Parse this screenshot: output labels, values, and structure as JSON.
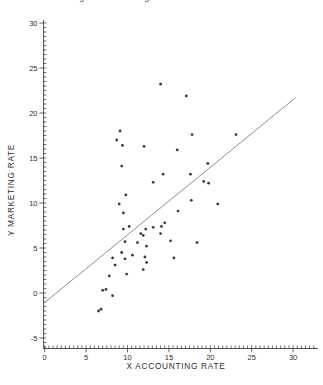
{
  "header": {
    "clipped_title": "accounting and marketing rates"
  },
  "chart_data": {
    "type": "scatter",
    "title": "",
    "xlabel": "X ACCOUNTING RATE",
    "ylabel": "Y MARKETING RATE",
    "xlim": [
      0,
      31.5
    ],
    "ylim": [
      -5,
      30
    ],
    "x_major_ticks": [
      0,
      5,
      10,
      15,
      20,
      25,
      30
    ],
    "y_major_ticks": [
      -5,
      0,
      5,
      10,
      15,
      20,
      25,
      30
    ],
    "minor_tick_step": 0.5,
    "grid": false,
    "legend": false,
    "points": [
      [
        14.0,
        23.2
      ],
      [
        17.1,
        21.9
      ],
      [
        9.1,
        18.0
      ],
      [
        17.8,
        17.6
      ],
      [
        23.1,
        17.6
      ],
      [
        8.7,
        17.0
      ],
      [
        9.4,
        16.4
      ],
      [
        12.0,
        16.3
      ],
      [
        16.0,
        15.9
      ],
      [
        9.3,
        14.1
      ],
      [
        19.7,
        14.4
      ],
      [
        14.3,
        13.2
      ],
      [
        17.6,
        13.2
      ],
      [
        13.1,
        12.3
      ],
      [
        19.2,
        12.4
      ],
      [
        19.8,
        12.2
      ],
      [
        9.8,
        10.9
      ],
      [
        17.7,
        10.3
      ],
      [
        9.0,
        9.9
      ],
      [
        20.9,
        9.9
      ],
      [
        16.1,
        9.1
      ],
      [
        9.5,
        8.9
      ],
      [
        14.5,
        7.8
      ],
      [
        10.2,
        7.4
      ],
      [
        13.1,
        7.3
      ],
      [
        14.1,
        7.4
      ],
      [
        9.5,
        7.1
      ],
      [
        12.2,
        7.1
      ],
      [
        11.6,
        6.6
      ],
      [
        11.9,
        6.4
      ],
      [
        14.0,
        6.6
      ],
      [
        15.2,
        5.8
      ],
      [
        18.4,
        5.6
      ],
      [
        9.7,
        5.7
      ],
      [
        11.2,
        5.6
      ],
      [
        12.3,
        5.2
      ],
      [
        9.3,
        4.5
      ],
      [
        10.6,
        4.2
      ],
      [
        12.1,
        4.0
      ],
      [
        15.6,
        3.9
      ],
      [
        8.2,
        3.9
      ],
      [
        9.7,
        3.8
      ],
      [
        12.3,
        3.4
      ],
      [
        8.5,
        3.1
      ],
      [
        11.9,
        2.6
      ],
      [
        9.9,
        2.1
      ],
      [
        7.8,
        1.9
      ],
      [
        7.4,
        0.4
      ],
      [
        7.0,
        0.3
      ],
      [
        8.2,
        -0.3
      ],
      [
        6.8,
        -1.8
      ],
      [
        6.5,
        -2.0
      ]
    ],
    "regression_line": {
      "x1": 0,
      "y1": -1.05,
      "x2": 30.3,
      "y2": 21.7
    },
    "colors": {
      "point": "#1f1f1f",
      "line": "#8f8f8f",
      "axis": "#3c3c3c",
      "text": "#2e2e2e"
    }
  }
}
